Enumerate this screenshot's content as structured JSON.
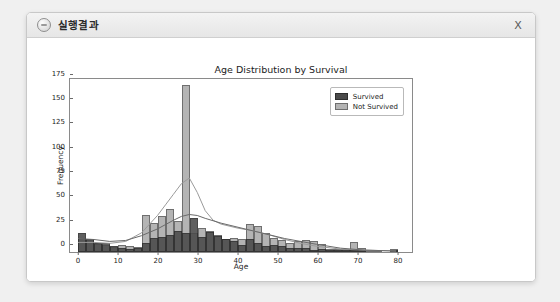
{
  "window": {
    "title": "실행결과",
    "icon": "app-circle-icon",
    "close_label": "X"
  },
  "chart_data": {
    "type": "bar",
    "subtype": "histogram-overlay-with-kde",
    "title": "Age Distribution by Survival",
    "xlabel": "Age",
    "ylabel": "Frequency",
    "xlim": [
      -2,
      84
    ],
    "ylim": [
      0,
      180
    ],
    "xticks": [
      0,
      10,
      20,
      30,
      40,
      50,
      60,
      70,
      80
    ],
    "yticks": [
      0,
      25,
      50,
      75,
      100,
      125,
      150,
      175
    ],
    "grid": false,
    "legend_position": "upper right",
    "bin_width": 2,
    "bin_starts": [
      0,
      2,
      4,
      6,
      8,
      10,
      12,
      14,
      16,
      18,
      20,
      22,
      24,
      26,
      28,
      30,
      32,
      34,
      36,
      38,
      40,
      42,
      44,
      46,
      48,
      50,
      52,
      54,
      56,
      58,
      60,
      62,
      64,
      66,
      68,
      70,
      72,
      74,
      76,
      78,
      80
    ],
    "series": [
      {
        "name": "Survived",
        "color": "#4a4a4a",
        "values": [
          20,
          13,
          9,
          9,
          6,
          4,
          3,
          4,
          9,
          14,
          15,
          18,
          22,
          20,
          35,
          15,
          21,
          16,
          13,
          11,
          7,
          13,
          9,
          6,
          7,
          6,
          4,
          4,
          4,
          2,
          3,
          2,
          1,
          1,
          1,
          1,
          0,
          0,
          0,
          1,
          0
        ]
      },
      {
        "name": "Not Survived",
        "color": "#b4b4b4",
        "values": [
          14,
          12,
          8,
          7,
          5,
          7,
          6,
          5,
          38,
          30,
          37,
          44,
          32,
          172,
          20,
          25,
          22,
          17,
          13,
          14,
          13,
          29,
          27,
          20,
          14,
          12,
          9,
          11,
          12,
          11,
          8,
          3,
          3,
          3,
          10,
          4,
          2,
          2,
          0,
          3,
          0
        ]
      }
    ],
    "kde_curves": [
      {
        "name": "Not Survived",
        "color": "#9a9a9a",
        "peak_x": 28,
        "peak_y": 77,
        "points_x": [
          0,
          4,
          8,
          12,
          16,
          18,
          20,
          22,
          24,
          26,
          28,
          30,
          32,
          34,
          36,
          40,
          44,
          48,
          52,
          56,
          60,
          66,
          72,
          80
        ],
        "points_y": [
          10,
          10,
          9,
          11,
          20,
          29,
          38,
          49,
          60,
          71,
          77,
          62,
          43,
          33,
          29,
          25,
          22,
          18,
          13,
          9,
          6,
          3,
          2,
          1
        ]
      },
      {
        "name": "Survived",
        "color": "#6a6a6a",
        "peak_x": 28,
        "peak_y": 39,
        "points_x": [
          0,
          4,
          8,
          12,
          16,
          20,
          24,
          26,
          28,
          30,
          32,
          36,
          40,
          44,
          48,
          52,
          56,
          60,
          66,
          72,
          80
        ],
        "points_y": [
          14,
          13,
          11,
          12,
          17,
          24,
          33,
          37,
          39,
          38,
          35,
          30,
          26,
          22,
          18,
          14,
          11,
          8,
          4,
          2,
          1
        ]
      }
    ],
    "legend": [
      "Survived",
      "Not Survived"
    ]
  }
}
